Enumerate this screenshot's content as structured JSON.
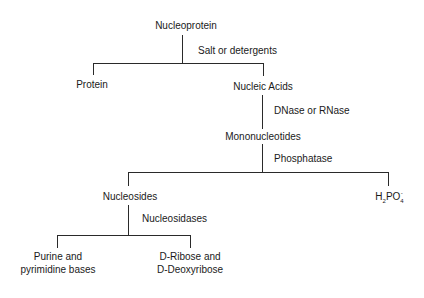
{
  "diagram": {
    "nodes": {
      "nucleoprotein": "Nucleoprotein",
      "protein": "Protein",
      "nucleic_acids": "Nucleic Acids",
      "mononucleotides": "Mononucleotides",
      "nucleosides": "Nucleosides",
      "phosphate": {
        "h": "H",
        "sub2": "2",
        "po": "PO",
        "sub4": "4",
        "sup": "-"
      },
      "bases_line1": "Purine  and",
      "bases_line2": "pyrimidine bases",
      "sugars_line1": "D-Ribose  and",
      "sugars_line2": "D-Deoxyribose"
    },
    "edges": {
      "salt_or_detergents": "Salt  or  detergents",
      "dnase_or_rnase": "DNase  or  RNase",
      "phosphatase": "Phosphatase",
      "nucleosidases": "Nucleosidases"
    },
    "line_color": "#2a2a2a",
    "text_color": "#1a1a1a"
  }
}
